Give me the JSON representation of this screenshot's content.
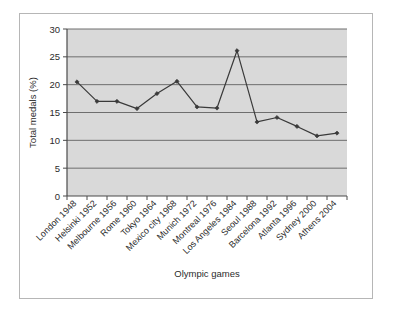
{
  "chart_data": {
    "type": "line",
    "title": "",
    "xlabel": "Olympic games",
    "ylabel": "Total medals (%)",
    "ylim": [
      0,
      30
    ],
    "ytick_step": 5,
    "yticks": [
      "0",
      "5",
      "10",
      "15",
      "20",
      "25",
      "30"
    ],
    "grid": true,
    "legend": false,
    "legend_position": "none",
    "plot_background": "#d9d9d9",
    "gridline_color": "#6e6e6e",
    "series_color": "#3a3a3a",
    "marker": "filled-diamond",
    "categories": [
      "London 1948",
      "Helsinki 1952",
      "Melbourne 1956",
      "Rome 1960",
      "Tokyo 1964",
      "Mexico city 1968",
      "Munich 1972",
      "Montreal 1976",
      "Los Angeles 1984",
      "Seoul 1988",
      "Barcelona 1992",
      "Atlanta 1996",
      "Sydney 2000",
      "Athens 2004"
    ],
    "values": [
      20.5,
      17.0,
      17.0,
      15.7,
      18.4,
      20.6,
      16.0,
      15.8,
      26.1,
      13.3,
      14.1,
      12.5,
      10.8,
      11.3
    ]
  },
  "figure": {
    "caption": ""
  }
}
